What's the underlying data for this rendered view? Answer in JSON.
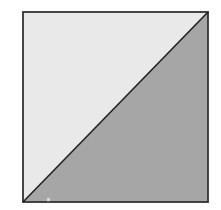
{
  "diagram": {
    "type": "square-split-by-diagonal",
    "square": {
      "x": 23,
      "y": 12,
      "width": 185,
      "height": 190,
      "stroke": "#333333"
    },
    "regions": [
      {
        "name": "upper-left-triangle",
        "fill": "#e9e9e9"
      },
      {
        "name": "lower-right-triangle",
        "fill": "#a6a6a6"
      }
    ],
    "diagonal": {
      "from": "bottom-left",
      "to": "top-right",
      "stroke": "#222222"
    },
    "marker": {
      "shape": "small-square",
      "x": 48,
      "y": 199
    }
  }
}
